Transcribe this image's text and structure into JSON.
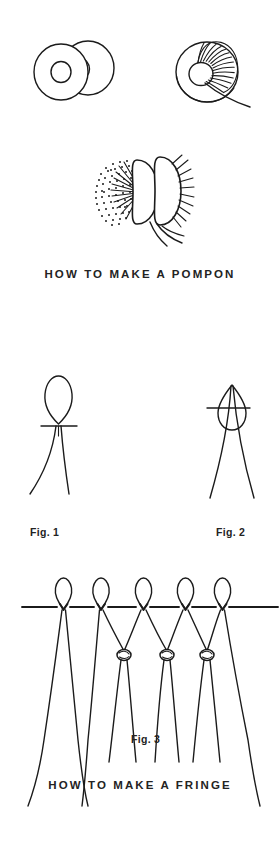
{
  "page": {
    "background_color": "#ffffff",
    "ink_color": "#1b1b1b",
    "width": 280,
    "height": 842
  },
  "sections": [
    {
      "id": "pompon",
      "caption": "HOW TO MAKE A POMPON",
      "illustrations": [
        {
          "name": "two-cardboard-rings",
          "description": "Two overlapping cardboard rings (doughnut shapes) side by side"
        },
        {
          "name": "ring-wound-with-yarn",
          "description": "Ring with yarn wound around the upper right portion and a loose trailing strand"
        },
        {
          "name": "cut-pompon-between-rings",
          "description": "Yarn cut around the edge, rings parted, fluffy stippled pompon emerging with tie strands"
        }
      ]
    },
    {
      "id": "fringe",
      "caption": "HOW TO MAKE A FRINGE",
      "figures": [
        {
          "label": "Fig. 1",
          "description": "Folded yarn loop held above the fabric edge with two tails hanging below"
        },
        {
          "label": "Fig. 2",
          "description": "Loop pulled through the fabric edge and the tails drawn through the loop"
        },
        {
          "label": "Fig. 3",
          "description": "Row of five knotted fringe loops along an edge, adjacent tails knotted together in a second row"
        }
      ]
    }
  ],
  "captions": {
    "pompon": "HOW TO MAKE A POMPON",
    "fringe": "HOW TO MAKE A FRINGE"
  },
  "labels": {
    "fig1": "Fig. 1",
    "fig2": "Fig. 2",
    "fig3": "Fig. 3"
  }
}
